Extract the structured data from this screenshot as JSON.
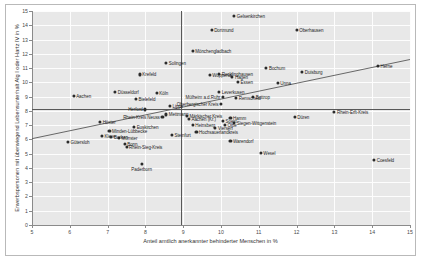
{
  "chart_data": {
    "type": "scatter",
    "title": "",
    "xlabel": "Anteil amtlich anerkannter behinderter Menschen in %",
    "ylabel": "Erwerbspersonen mit überwiegend Lebensunterhalt Alg I oder Hartz IV in %",
    "xlim": [
      5,
      15
    ],
    "ylim": [
      0,
      15
    ],
    "xticks": [
      5,
      6,
      7,
      8,
      9,
      10,
      11,
      12,
      13,
      14,
      15
    ],
    "yticks": [
      0,
      1,
      2,
      3,
      4,
      5,
      6,
      7,
      8,
      9,
      10,
      11,
      12,
      13,
      14,
      15
    ],
    "grid": true,
    "legend": "none",
    "panel_color": "#e8e8e8",
    "grid_color": "#fdfdfd",
    "point_color": "#2b2b2b",
    "line_color": "#585858",
    "reference_lines": {
      "horizontal_y": 8.1,
      "vertical_x": 8.95
    },
    "regression_line": {
      "x0": 5.0,
      "y0": 6.05,
      "x1": 15.0,
      "y1": 11.6
    },
    "points": [
      {
        "label": "Gelsenkirchen",
        "x": 10.35,
        "y": 14.65,
        "lp": "right"
      },
      {
        "label": "Dortmund",
        "x": 9.75,
        "y": 13.7,
        "lp": "right"
      },
      {
        "label": "Oberhausen",
        "x": 12.0,
        "y": 13.65,
        "lp": "right"
      },
      {
        "label": "Mönchengladbach",
        "x": 9.25,
        "y": 12.2,
        "lp": "right"
      },
      {
        "label": "Solingen",
        "x": 8.55,
        "y": 11.35,
        "lp": "right"
      },
      {
        "label": "Herne",
        "x": 14.15,
        "y": 11.15,
        "lp": "right"
      },
      {
        "label": "Bochum",
        "x": 11.2,
        "y": 11.0,
        "lp": "right"
      },
      {
        "label": "Duisburg",
        "x": 12.15,
        "y": 10.7,
        "lp": "right"
      },
      {
        "label": "Recklinghausen",
        "x": 9.95,
        "y": 10.6,
        "lp": "right"
      },
      {
        "label": "Wuppertal",
        "x": 9.7,
        "y": 10.5,
        "lp": "right"
      },
      {
        "label": "Hagen",
        "x": 10.3,
        "y": 10.35,
        "lp": "right"
      },
      {
        "label": "Krefeld",
        "x": 7.85,
        "y": 10.55,
        "lp": "right"
      },
      {
        "label": "Unna",
        "x": 11.5,
        "y": 9.95,
        "lp": "right"
      },
      {
        "label": "Essen",
        "x": 10.45,
        "y": 10.0,
        "lp": "right"
      },
      {
        "label": "Leverkusen",
        "x": 9.95,
        "y": 9.35,
        "lp": "right"
      },
      {
        "label": "Düsseldorf",
        "x": 7.2,
        "y": 9.35,
        "lp": "right"
      },
      {
        "label": "Aachen",
        "x": 6.1,
        "y": 9.05,
        "lp": "right"
      },
      {
        "label": "Köln",
        "x": 8.3,
        "y": 9.25,
        "lp": "right"
      },
      {
        "label": "Mülheim a.d.Ruhr",
        "x": 10.05,
        "y": 8.95,
        "lp": "left"
      },
      {
        "label": "Bottrop",
        "x": 10.85,
        "y": 9.0,
        "lp": "right"
      },
      {
        "label": "Remscheid",
        "x": 10.4,
        "y": 8.9,
        "lp": "right"
      },
      {
        "label": "Oberbergischer Kreis",
        "x": 10.0,
        "y": 8.5,
        "lp": "left"
      },
      {
        "label": "Bielefeld",
        "x": 7.75,
        "y": 8.85,
        "lp": "right"
      },
      {
        "label": "Herford",
        "x": 8.0,
        "y": 8.1,
        "lp": "left"
      },
      {
        "label": "Lippe",
        "x": 8.65,
        "y": 8.35,
        "lp": "right"
      },
      {
        "label": "Düren",
        "x": 11.95,
        "y": 7.6,
        "lp": "right"
      },
      {
        "label": "Märkischer Kreis",
        "x": 9.1,
        "y": 7.65,
        "lp": "right"
      },
      {
        "label": "Hamm",
        "x": 10.25,
        "y": 7.5,
        "lp": "right"
      },
      {
        "label": "Höxter",
        "x": 6.8,
        "y": 7.2,
        "lp": "right"
      },
      {
        "label": "Siegen-Wittgenstein",
        "x": 10.35,
        "y": 7.15,
        "lp": "right"
      },
      {
        "label": "Soest",
        "x": 10.05,
        "y": 7.3,
        "lp": "right"
      },
      {
        "label": "Olpe",
        "x": 10.1,
        "y": 7.0,
        "lp": "right"
      },
      {
        "label": "Aachen (Kr.)",
        "x": 9.15,
        "y": 7.45,
        "lp": "right"
      },
      {
        "label": "Heinsberg",
        "x": 9.25,
        "y": 7.0,
        "lp": "right"
      },
      {
        "label": "Viersen",
        "x": 9.85,
        "y": 6.8,
        "lp": "right"
      },
      {
        "label": "Hochsauerlandkreis",
        "x": 9.35,
        "y": 6.55,
        "lp": "right"
      },
      {
        "label": "Euskirchen",
        "x": 7.7,
        "y": 6.85,
        "lp": "right"
      },
      {
        "label": "Minden-Lübbecke",
        "x": 7.05,
        "y": 6.6,
        "lp": "right"
      },
      {
        "label": "Steinfurt",
        "x": 8.7,
        "y": 6.3,
        "lp": "right"
      },
      {
        "label": "Kleve",
        "x": 6.85,
        "y": 6.25,
        "lp": "right"
      },
      {
        "label": "Wesel",
        "x": 11.05,
        "y": 5.05,
        "lp": "right"
      },
      {
        "label": "Münster",
        "x": 7.3,
        "y": 6.1,
        "lp": "right"
      },
      {
        "label": "Warendorf",
        "x": 10.25,
        "y": 5.9,
        "lp": "right"
      },
      {
        "label": "Gütersloh",
        "x": 5.95,
        "y": 5.85,
        "lp": "right"
      },
      {
        "label": "Borken",
        "x": 7.1,
        "y": 6.2,
        "lp": "right"
      },
      {
        "label": "Rhein-Sieg-Kreis",
        "x": 7.5,
        "y": 5.5,
        "lp": "right"
      },
      {
        "label": "Bonn",
        "x": 7.45,
        "y": 5.65,
        "lp": "right"
      },
      {
        "label": "Coesfeld",
        "x": 14.05,
        "y": 4.55,
        "lp": "right"
      },
      {
        "label": "Paderborn",
        "x": 7.9,
        "y": 4.25,
        "lp": "center"
      },
      {
        "label": "Rhein-Erft-Kreis",
        "x": 13.0,
        "y": 7.9,
        "lp": "right"
      },
      {
        "label": "Rhein-Kreis Neuss",
        "x": 8.45,
        "y": 7.55,
        "lp": "left"
      },
      {
        "label": "Mettmann",
        "x": 8.55,
        "y": 7.75,
        "lp": "right"
      }
    ]
  }
}
